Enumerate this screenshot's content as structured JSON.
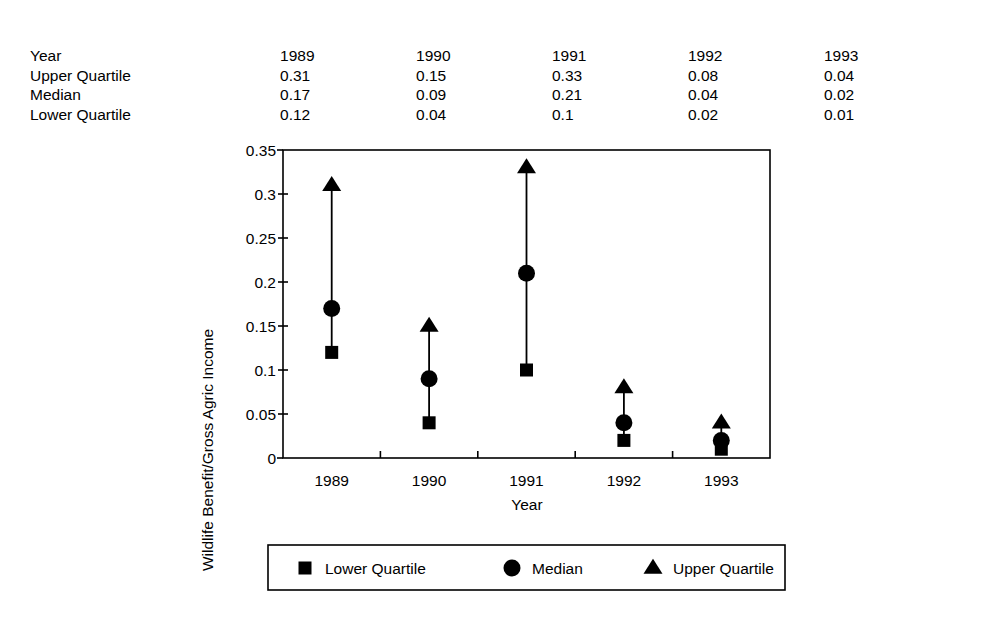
{
  "table": {
    "row_labels": [
      "Year",
      "Upper Quartile",
      "Median",
      "Lower Quartile"
    ],
    "columns": [
      "1989",
      "1990",
      "1991",
      "1992",
      "1993"
    ],
    "rows": [
      {
        "label": "Year",
        "values": [
          "1989",
          "1990",
          "1991",
          "1992",
          "1993"
        ]
      },
      {
        "label": "Upper Quartile",
        "values": [
          "0.31",
          "0.15",
          "0.33",
          "0.08",
          "0.04"
        ]
      },
      {
        "label": "Median",
        "values": [
          "0.17",
          "0.09",
          "0.21",
          "0.04",
          "0.02"
        ]
      },
      {
        "label": "Lower Quartile",
        "values": [
          "0.12",
          "0.04",
          "0.1",
          "0.02",
          "0.01"
        ]
      }
    ]
  },
  "chart_data": {
    "type": "scatter",
    "title": "",
    "xlabel": "Year",
    "ylabel": "Wildlife Benefit/Gross Agric Income",
    "categories": [
      "1989",
      "1990",
      "1991",
      "1992",
      "1993"
    ],
    "ylim": [
      0,
      0.35
    ],
    "yticks": [
      0,
      0.05,
      0.1,
      0.15,
      0.2,
      0.25,
      0.3,
      0.35
    ],
    "ytick_labels": [
      "0",
      "0.05",
      "0.1",
      "0.15",
      "0.2",
      "0.25",
      "0.3",
      "0.35"
    ],
    "grid": false,
    "legend_position": "below",
    "series": [
      {
        "name": "Lower Quartile",
        "marker": "square",
        "values": [
          0.12,
          0.04,
          0.1,
          0.02,
          0.01
        ]
      },
      {
        "name": "Median",
        "marker": "circle",
        "values": [
          0.17,
          0.09,
          0.21,
          0.04,
          0.02
        ]
      },
      {
        "name": "Upper Quartile",
        "marker": "triangle",
        "values": [
          0.31,
          0.15,
          0.33,
          0.08,
          0.04
        ]
      }
    ],
    "marker_color": "#000000",
    "stem_color": "#000000"
  },
  "legend": {
    "items": [
      {
        "label": "Lower Quartile",
        "marker": "square"
      },
      {
        "label": "Median",
        "marker": "circle"
      },
      {
        "label": "Upper Quartile",
        "marker": "triangle"
      }
    ]
  }
}
